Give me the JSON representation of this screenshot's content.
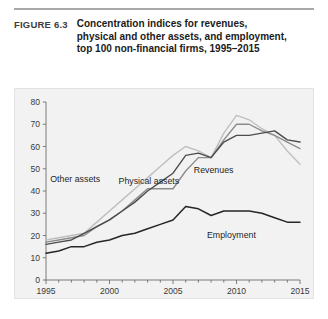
{
  "figure": {
    "number": "FIGURE 6.3",
    "title": "Concentration indices for revenues, physical and other assets, and employment, top 100 non-financial firms, 1995–2015"
  },
  "colors": {
    "panel_background": "#f2f2f2",
    "page_background": "#ffffff",
    "axis": "#6e6e6e",
    "revenues": "#4d4d4d",
    "physical_assets": "#8c8c8c",
    "other_assets": "#bfbfbf",
    "employment": "#262626",
    "rule": "#a8a8a8"
  },
  "chart_data": {
    "type": "line",
    "title": "",
    "xlabel": "",
    "ylabel": "",
    "xlim": [
      1995,
      2015
    ],
    "ylim": [
      0,
      80
    ],
    "ytick_step": 10,
    "grid": false,
    "legend": "inline-annotations",
    "xticks": [
      1995,
      1996,
      1997,
      1998,
      1999,
      2000,
      2001,
      2002,
      2003,
      2004,
      2005,
      2006,
      2007,
      2008,
      2009,
      2010,
      2011,
      2012,
      2013,
      2014,
      2015
    ],
    "xtick_labels": [
      "1995",
      "",
      "",
      "",
      "",
      "2000",
      "",
      "",
      "",
      "",
      "2005",
      "",
      "",
      "",
      "",
      "2010",
      "",
      "",
      "",
      "",
      "2015"
    ],
    "yticks": [
      0,
      10,
      20,
      30,
      40,
      50,
      60,
      70,
      80
    ],
    "ytick_labels": [
      "0",
      "10",
      "20",
      "30",
      "40",
      "50",
      "60",
      "70",
      "80"
    ],
    "x": [
      1995,
      1996,
      1997,
      1998,
      1999,
      2000,
      2001,
      2002,
      2003,
      2004,
      2005,
      2006,
      2007,
      2008,
      2009,
      2010,
      2011,
      2012,
      2013,
      2014,
      2015
    ],
    "series": [
      {
        "name": "Revenues",
        "color": "#4d4d4d",
        "label_x": 2008.2,
        "label_y": 48,
        "values": [
          16,
          17,
          18,
          21,
          24,
          27,
          31,
          35,
          40,
          44,
          48,
          56,
          57,
          55,
          62,
          65,
          65,
          66,
          67,
          63,
          62
        ]
      },
      {
        "name": "Physical assets",
        "color": "#8c8c8c",
        "label_x": 2003.1,
        "label_y": 43,
        "values": [
          17,
          18,
          19,
          20,
          24,
          27,
          31,
          36,
          41,
          41,
          41,
          49,
          55,
          55,
          63,
          70,
          70,
          67,
          65,
          62,
          59
        ]
      },
      {
        "name": "Other assets",
        "color": "#bfbfbf",
        "label_x": 1997.3,
        "label_y": 44,
        "values": [
          18,
          19,
          20,
          21,
          26,
          31,
          36,
          41,
          46,
          51,
          56,
          60,
          58,
          55,
          66,
          74,
          72,
          68,
          65,
          58,
          52
        ]
      },
      {
        "name": "Employment",
        "color": "#262626",
        "label_x": 2009.6,
        "label_y": 19,
        "values": [
          12,
          13,
          15,
          15,
          17,
          18,
          20,
          21,
          23,
          25,
          27,
          33,
          32,
          29,
          31,
          31,
          31,
          30,
          28,
          26,
          26
        ]
      }
    ]
  }
}
